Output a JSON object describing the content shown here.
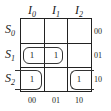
{
  "diagram": {
    "type": "karnaugh-map",
    "columns": [
      {
        "var": "I",
        "sub": "0",
        "code": "00"
      },
      {
        "var": "I",
        "sub": "1",
        "code": "01"
      },
      {
        "var": "I",
        "sub": "2",
        "code": "10"
      }
    ],
    "rows": [
      {
        "var": "S",
        "sub": "0",
        "code": "00"
      },
      {
        "var": "S",
        "sub": "1",
        "code": "01"
      },
      {
        "var": "S",
        "sub": "2",
        "code": "10"
      }
    ],
    "cells": [
      [
        "",
        "",
        ""
      ],
      [
        "1",
        "1",
        ""
      ],
      [
        "1",
        "",
        "1"
      ]
    ],
    "groups": [
      {
        "cells": [
          [
            1,
            0
          ],
          [
            1,
            1
          ]
        ],
        "description": "row S1 spanning I0 and I1"
      },
      {
        "cells": [
          [
            2,
            0
          ],
          [
            2,
            2
          ]
        ],
        "description": "row S2 wrap-around I0 and I2"
      }
    ]
  }
}
